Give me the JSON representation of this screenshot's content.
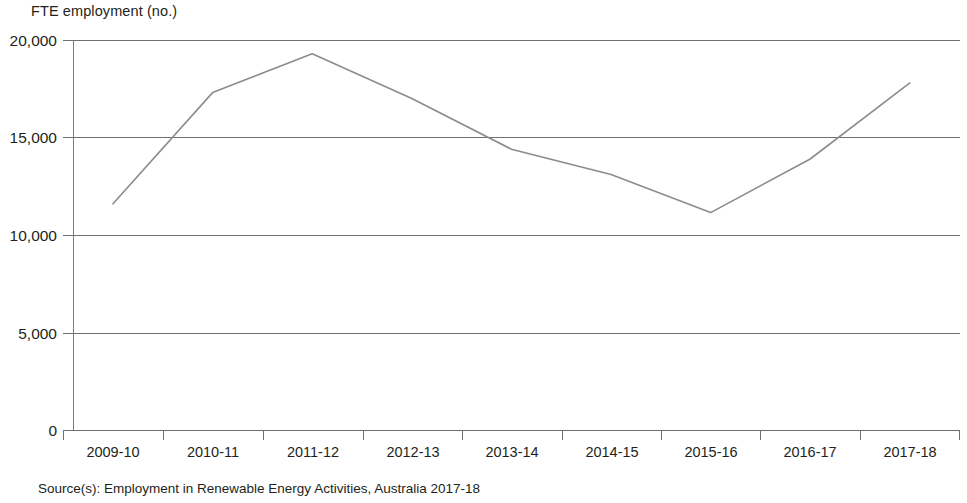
{
  "chart_data": {
    "type": "line",
    "title": "",
    "ylabel": "FTE employment (no.)",
    "xlabel": "",
    "categories": [
      "2009-10",
      "2010-11",
      "2011-12",
      "2012-13",
      "2013-14",
      "2014-15",
      "2015-16",
      "2016-17",
      "2017-18"
    ],
    "values": [
      11600,
      17300,
      19300,
      17000,
      14400,
      13100,
      11150,
      13900,
      17800
    ],
    "series": [
      {
        "name": "FTE employment (no.)",
        "values": [
          11600,
          17300,
          19300,
          17000,
          14400,
          13100,
          11150,
          13900,
          17800
        ]
      }
    ],
    "ylim": [
      0,
      20000
    ],
    "ytick_labels": [
      "0",
      "5,000",
      "10,000",
      "15,000",
      "20,000"
    ],
    "ytick_values": [
      0,
      5000,
      10000,
      15000,
      20000
    ],
    "grid": "horizontal",
    "legend": "none",
    "line_color": "#8c8c8c",
    "axis_color": "#6f6f6f"
  },
  "axis_title": "FTE employment (no.)",
  "source_note": "Source(s): Employment in Renewable Energy Activities, Australia 2017-18"
}
